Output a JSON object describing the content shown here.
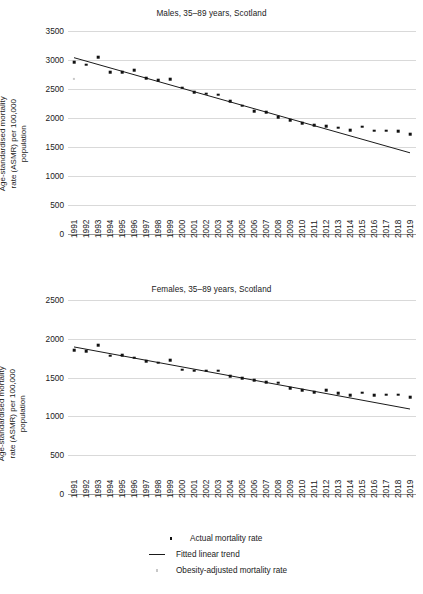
{
  "figure": {
    "ylabel": "Age-standardised mortality\nrate (ASMR) per 100,000 population"
  },
  "legend": {
    "actual": "Actual mortality rate",
    "trend": "Fitted linear trend",
    "obesity": "Obesity-adjusted mortality rate",
    "actual_icon": "filled-square-marker",
    "trend_icon": "solid-line-marker",
    "obesity_icon": "light-square-marker"
  },
  "chart_data": [
    {
      "type": "scatter",
      "id": "males",
      "title": "Males, 35–89 years, Scotland",
      "xlabel": "",
      "ylabel": "Age-standardised mortality rate (ASMR) per 100,000 population",
      "ylim": [
        0,
        3500
      ],
      "yticks": [
        0,
        500,
        1000,
        1500,
        2000,
        2500,
        3000,
        3500
      ],
      "grid": true,
      "legend_position": "below-figure",
      "x": [
        1991,
        1992,
        1993,
        1994,
        1995,
        1996,
        1997,
        1998,
        1999,
        2000,
        2001,
        2002,
        2003,
        2004,
        2005,
        2006,
        2007,
        2008,
        2009,
        2010,
        2011,
        2012,
        2013,
        2014,
        2015,
        2016,
        2017,
        2018,
        2019
      ],
      "series": [
        {
          "name": "Actual mortality rate",
          "marker": "square",
          "color": "#111111",
          "values": [
            2960,
            2920,
            3050,
            2790,
            2790,
            2820,
            2690,
            2650,
            2670,
            2520,
            2440,
            2420,
            2400,
            2290,
            2210,
            2120,
            2100,
            2010,
            1960,
            1910,
            1880,
            1860,
            1830,
            1790,
            1850,
            1780,
            1780,
            1775,
            1720
          ]
        },
        {
          "name": "Obesity-adjusted mortality rate",
          "marker": "square",
          "color": "#c8c8c8",
          "values": [
            2680,
            null,
            null,
            null,
            null,
            null,
            null,
            null,
            null,
            null,
            null,
            null,
            null,
            null,
            null,
            null,
            null,
            null,
            null,
            null,
            null,
            null,
            null,
            null,
            null,
            null,
            null,
            null,
            null
          ]
        }
      ],
      "trend": {
        "name": "Fitted linear trend",
        "color": "#1a1a1a",
        "x_start": 1991,
        "x_end": 2019,
        "y_start": 3040,
        "y_end": 1400
      }
    },
    {
      "type": "scatter",
      "id": "females",
      "title": "Females, 35–89 years, Scotland",
      "xlabel": "",
      "ylabel": "Age-standardised mortality rate (ASMR) per 100,000 population",
      "ylim": [
        0,
        2500
      ],
      "yticks": [
        0,
        500,
        1000,
        1500,
        2000,
        2500
      ],
      "grid": true,
      "legend_position": "below-figure",
      "x": [
        1991,
        1992,
        1993,
        1994,
        1995,
        1996,
        1997,
        1998,
        1999,
        2000,
        2001,
        2002,
        2003,
        2004,
        2005,
        2006,
        2007,
        2008,
        2009,
        2010,
        2011,
        2012,
        2013,
        2014,
        2015,
        2016,
        2017,
        2018,
        2019
      ],
      "series": [
        {
          "name": "Actual mortality rate",
          "marker": "square",
          "color": "#111111",
          "values": [
            1855,
            1840,
            1920,
            1780,
            1785,
            1755,
            1715,
            1690,
            1725,
            1600,
            1590,
            1590,
            1590,
            1520,
            1490,
            1465,
            1440,
            1435,
            1365,
            1335,
            1310,
            1335,
            1300,
            1275,
            1305,
            1270,
            1280,
            1280,
            1245
          ]
        },
        {
          "name": "Obesity-adjusted mortality rate",
          "marker": "square",
          "color": "#c8c8c8",
          "values": [
            null,
            null,
            null,
            null,
            null,
            null,
            null,
            null,
            null,
            null,
            null,
            null,
            null,
            null,
            null,
            null,
            null,
            null,
            null,
            null,
            null,
            null,
            null,
            null,
            null,
            null,
            null,
            null,
            null
          ]
        }
      ],
      "trend": {
        "name": "Fitted linear trend",
        "color": "#1a1a1a",
        "x_start": 1991,
        "x_end": 2019,
        "y_start": 1895,
        "y_end": 1095
      }
    }
  ]
}
